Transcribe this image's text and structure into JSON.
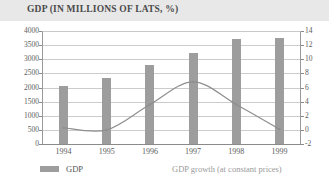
{
  "chart_data": {
    "type": "bar",
    "title": "GDP (IN MILLIONS OF LATS, %)",
    "xlabel": "",
    "ylabel": "",
    "grid": true,
    "legend_position": "bottom",
    "categories": [
      "1994",
      "1995",
      "1996",
      "1997",
      "1998",
      "1999"
    ],
    "series": [
      {
        "name": "GDP",
        "type": "bar",
        "axis": "left",
        "unit": "millions of lats",
        "color": "#9d9d9d",
        "values": [
          2050,
          2330,
          2790,
          3230,
          3700,
          3760
        ]
      },
      {
        "name": "GDP growth (at constant prices)",
        "type": "line",
        "axis": "right",
        "unit": "%",
        "color": "#8e8e8e",
        "values": [
          0.3,
          0.0,
          3.6,
          6.8,
          3.6,
          0.1
        ]
      }
    ],
    "left_axis": {
      "ticks": [
        "0",
        "500",
        "1000",
        "1500",
        "2000",
        "2500",
        "3000",
        "3500",
        "4000"
      ],
      "values": [
        0,
        500,
        1000,
        1500,
        2000,
        2500,
        3000,
        3500,
        4000
      ],
      "ylim": [
        0,
        4000
      ]
    },
    "right_axis": {
      "ticks": [
        "-2",
        "0",
        "2",
        "4",
        "6",
        "8",
        "10",
        "12",
        "14"
      ],
      "values": [
        -2,
        0,
        2,
        4,
        6,
        8,
        10,
        12,
        14
      ],
      "ylim": [
        -2,
        14
      ]
    }
  },
  "legend": {
    "bar_label": "GDP",
    "line_label": "GDP growth (at constant prices)"
  },
  "colors": {
    "bar": "#9d9d9d",
    "line": "#8e8e8e",
    "title_band": "#e8e8e8",
    "grid": "#cccccc",
    "axis": "#8a8a8a",
    "text": "#5c5c5c",
    "muted_text": "#9a9a9a"
  }
}
